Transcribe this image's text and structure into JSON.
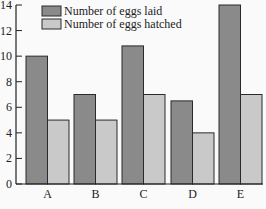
{
  "chart_data": {
    "type": "bar",
    "title": "",
    "xlabel": "",
    "ylabel": "",
    "categories": [
      "A",
      "B",
      "C",
      "D",
      "E"
    ],
    "series": [
      {
        "name": "Number of eggs laid",
        "color": "#8a8a8a",
        "values": [
          10,
          7,
          10.8,
          6.5,
          14
        ]
      },
      {
        "name": "Number of eggs hatched",
        "color": "#c9c9c9",
        "values": [
          5,
          5,
          7,
          4,
          7
        ]
      }
    ],
    "ylim": [
      0,
      14
    ],
    "yticks": [
      0,
      2,
      4,
      6,
      8,
      10,
      12,
      14
    ],
    "grid": false,
    "legend_position": "top-center"
  }
}
